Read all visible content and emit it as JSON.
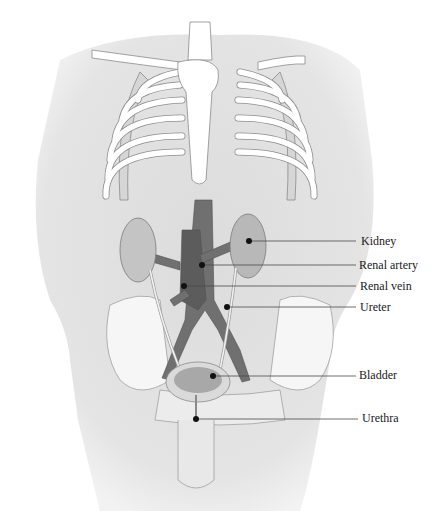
{
  "diagram": {
    "colors": {
      "body": "#e2e2e2",
      "bone": "#ffffff",
      "bone_outline": "#8a8a8a",
      "vessel": "#6e6e6e",
      "organ": "#bdbdbd",
      "leader": "#4a4a4a",
      "dot": "#111111"
    },
    "labels": [
      {
        "text": "Kidney",
        "dot": [
          249,
          241
        ],
        "line_y": 241
      },
      {
        "text": "Renal artery",
        "dot": [
          202,
          265
        ],
        "line_y": 265
      },
      {
        "text": "Renal vein",
        "dot": [
          184,
          286
        ],
        "line_y": 286
      },
      {
        "text": "Ureter",
        "dot": [
          227,
          307
        ],
        "line_y": 307
      },
      {
        "text": "Bladder",
        "dot": [
          213,
          376
        ],
        "line_y": 376
      },
      {
        "text": "Urethra",
        "dot": [
          196,
          419
        ],
        "line_y": 419
      }
    ]
  }
}
